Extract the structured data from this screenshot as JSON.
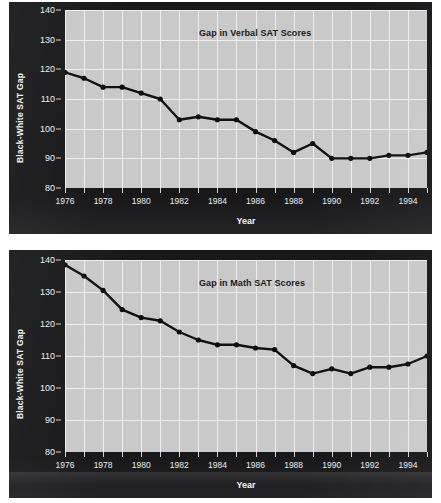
{
  "figure": {
    "background_color": "#ffffff",
    "panel_color": "#18181a",
    "plot_color": "#c9c9c9",
    "grid_color": "#efefef",
    "series_color": "#101010"
  },
  "charts": [
    {
      "id": "verbal",
      "title": "Gap in Verbal SAT Scores",
      "ylabel": "Black-White SAT Gap",
      "xlabel": "Year",
      "ytick_labels": [
        "140",
        "130",
        "120",
        "110",
        "100",
        "90",
        "80"
      ],
      "xtick_labels": [
        "1976",
        "",
        "1978",
        "",
        "1980",
        "",
        "1982",
        "",
        "1984",
        "",
        "1986",
        "",
        "1988",
        "",
        "1990",
        "",
        "1992",
        "",
        "1994",
        ""
      ]
    },
    {
      "id": "math",
      "title": "Gap in Math SAT Scores",
      "ylabel": "Black-White SAT Gap",
      "xlabel": "Year",
      "ytick_labels": [
        "140",
        "130",
        "120",
        "110",
        "100",
        "90",
        "80"
      ],
      "xtick_labels": [
        "1976",
        "",
        "1978",
        "",
        "1980",
        "",
        "1982",
        "",
        "1984",
        "",
        "1986",
        "",
        "1988",
        "",
        "1990",
        "",
        "1992",
        "",
        "1994",
        ""
      ]
    }
  ],
  "chart_data": [
    {
      "type": "line",
      "title": "Gap in Verbal SAT Scores",
      "xlabel": "Year",
      "ylabel": "Black-White SAT Gap",
      "xlim": [
        1976,
        1995
      ],
      "ylim": [
        80,
        140
      ],
      "ytick_values": [
        80,
        90,
        100,
        110,
        120,
        130,
        140
      ],
      "xtick_values": [
        1976,
        1978,
        1980,
        1982,
        1984,
        1986,
        1988,
        1990,
        1992,
        1994
      ],
      "grid": true,
      "legend": "none",
      "markers": true,
      "x": [
        1976,
        1977,
        1978,
        1979,
        1980,
        1981,
        1982,
        1983,
        1984,
        1985,
        1986,
        1987,
        1988,
        1989,
        1990,
        1991,
        1992,
        1993,
        1994,
        1995
      ],
      "values": [
        119,
        117,
        114,
        114,
        112,
        110,
        103,
        104,
        103,
        103,
        99,
        96,
        92,
        95,
        90,
        90,
        90,
        91,
        91,
        92
      ]
    },
    {
      "type": "line",
      "title": "Gap in Math SAT Scores",
      "xlabel": "Year",
      "ylabel": "Black-White SAT Gap",
      "xlim": [
        1976,
        1995
      ],
      "ylim": [
        80,
        140
      ],
      "ytick_values": [
        80,
        90,
        100,
        110,
        120,
        130,
        140
      ],
      "xtick_values": [
        1976,
        1978,
        1980,
        1982,
        1984,
        1986,
        1988,
        1990,
        1992,
        1994
      ],
      "grid": true,
      "legend": "none",
      "markers": true,
      "x": [
        1976,
        1977,
        1978,
        1979,
        1980,
        1981,
        1982,
        1983,
        1984,
        1985,
        1986,
        1987,
        1988,
        1989,
        1990,
        1991,
        1992,
        1993,
        1994,
        1995
      ],
      "values": [
        138.5,
        135,
        130.5,
        124.5,
        122,
        121,
        117.5,
        115,
        113.5,
        113.5,
        112.5,
        112,
        107,
        104.5,
        106,
        104.5,
        106.5,
        106.5,
        107.5,
        110
      ]
    }
  ]
}
